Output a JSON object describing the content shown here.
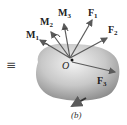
{
  "figure": {
    "equivalence_symbol": "≡",
    "caption": "(b)",
    "origin_label": "O",
    "moments": [
      {
        "name": "M",
        "sub": "1"
      },
      {
        "name": "M",
        "sub": "2"
      },
      {
        "name": "M",
        "sub": "3"
      }
    ],
    "forces": [
      {
        "name": "F",
        "sub": "1"
      },
      {
        "name": "F",
        "sub": "2"
      },
      {
        "name": "F",
        "sub": "3"
      }
    ],
    "colors": {
      "body_light": "#eeeeee",
      "body_dark": "#8f8f8f",
      "vector": "#5a5a5a"
    }
  }
}
